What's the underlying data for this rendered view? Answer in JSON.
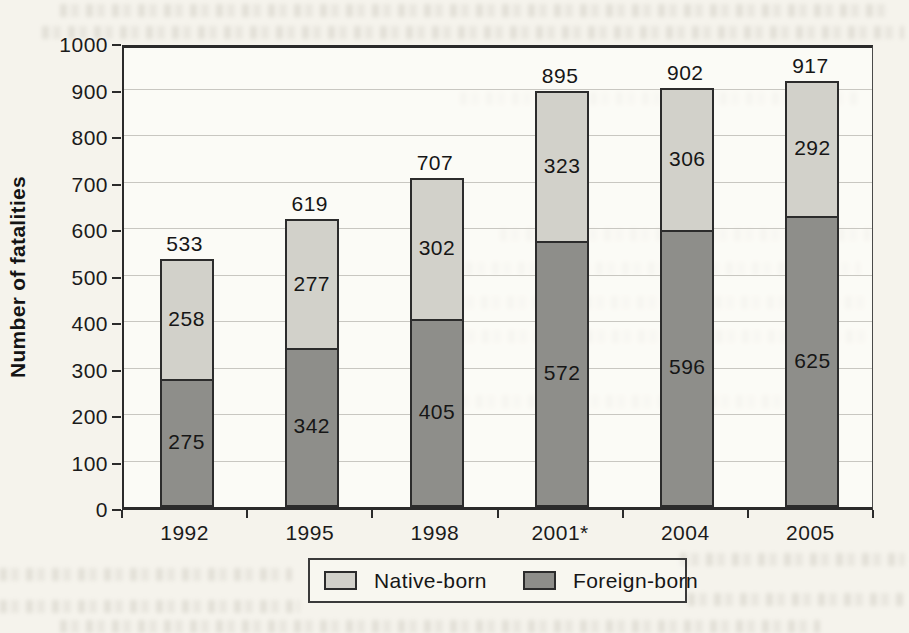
{
  "figure": {
    "kind": "scanned-book-bar-chart"
  },
  "chart_data": {
    "type": "bar",
    "stacked": true,
    "categories": [
      "1992",
      "1995",
      "1998",
      "2001*",
      "2004",
      "2005"
    ],
    "series": [
      {
        "name": "Foreign-born",
        "color": "#8e8e8a",
        "values": [
          275,
          342,
          405,
          572,
          596,
          625
        ]
      },
      {
        "name": "Native-born",
        "color": "#d2d1ca",
        "values": [
          258,
          277,
          302,
          323,
          306,
          292
        ]
      }
    ],
    "totals": [
      533,
      619,
      707,
      895,
      902,
      917
    ],
    "title": "",
    "xlabel": "",
    "ylabel": "Number of fatalities",
    "ylim": [
      0,
      1000
    ],
    "ytick_step": 100,
    "grid": true,
    "legend_position": "bottom",
    "legend": [
      {
        "label": "Native-born",
        "color": "#d2d1ca"
      },
      {
        "label": "Foreign-born",
        "color": "#8e8e8a"
      }
    ]
  }
}
